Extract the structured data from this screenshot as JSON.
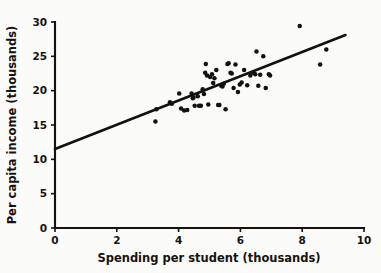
{
  "chart_data": {
    "type": "scatter",
    "title": "",
    "xlabel": "Spending per student (thousands)",
    "ylabel": "Per capita income (thousands)",
    "xlim": [
      0,
      10
    ],
    "ylim": [
      0,
      30
    ],
    "xticks": [
      "0",
      "2",
      "4",
      "6",
      "8",
      "10"
    ],
    "xtick_values": [
      0,
      2,
      4,
      6,
      8,
      10
    ],
    "yticks": [
      "0",
      "5",
      "10",
      "15",
      "20",
      "25",
      "30"
    ],
    "ytick_values": [
      0,
      5,
      10,
      15,
      20,
      25,
      30
    ],
    "grid": false,
    "legend": "none",
    "points": [
      [
        3.25,
        15.5
      ],
      [
        3.28,
        17.3
      ],
      [
        3.72,
        18.3
      ],
      [
        3.78,
        18.1
      ],
      [
        4.02,
        19.6
      ],
      [
        4.08,
        17.4
      ],
      [
        4.18,
        17.1
      ],
      [
        4.28,
        17.2
      ],
      [
        4.42,
        19.6
      ],
      [
        4.46,
        18.9
      ],
      [
        4.48,
        19.0
      ],
      [
        4.52,
        17.8
      ],
      [
        4.62,
        19.2
      ],
      [
        4.66,
        17.8
      ],
      [
        4.72,
        17.8
      ],
      [
        4.78,
        20.2
      ],
      [
        4.82,
        19.5
      ],
      [
        4.86,
        22.6
      ],
      [
        4.88,
        23.9
      ],
      [
        4.92,
        22.2
      ],
      [
        4.96,
        18.0
      ],
      [
        5.02,
        22.0
      ],
      [
        5.08,
        22.4
      ],
      [
        5.12,
        21.1
      ],
      [
        5.16,
        21.8
      ],
      [
        5.22,
        23.0
      ],
      [
        5.28,
        17.9
      ],
      [
        5.32,
        17.9
      ],
      [
        5.38,
        20.7
      ],
      [
        5.42,
        20.6
      ],
      [
        5.46,
        21.0
      ],
      [
        5.52,
        17.3
      ],
      [
        5.58,
        23.9
      ],
      [
        5.62,
        24.0
      ],
      [
        5.68,
        22.6
      ],
      [
        5.72,
        22.5
      ],
      [
        5.78,
        20.4
      ],
      [
        5.84,
        23.8
      ],
      [
        5.92,
        19.8
      ],
      [
        5.98,
        20.9
      ],
      [
        6.04,
        21.2
      ],
      [
        6.12,
        23.0
      ],
      [
        6.22,
        20.8
      ],
      [
        6.32,
        22.2
      ],
      [
        6.42,
        22.6
      ],
      [
        6.48,
        22.4
      ],
      [
        6.52,
        25.7
      ],
      [
        6.58,
        20.7
      ],
      [
        6.64,
        22.3
      ],
      [
        6.74,
        25.0
      ],
      [
        6.82,
        20.4
      ],
      [
        6.92,
        22.4
      ],
      [
        6.96,
        22.2
      ],
      [
        7.92,
        29.4
      ],
      [
        8.58,
        23.8
      ],
      [
        8.78,
        26.0
      ]
    ],
    "regression_line": {
      "x_start": 0,
      "y_start": 11.5,
      "x_end": 9.4,
      "y_end": 28.1
    }
  }
}
